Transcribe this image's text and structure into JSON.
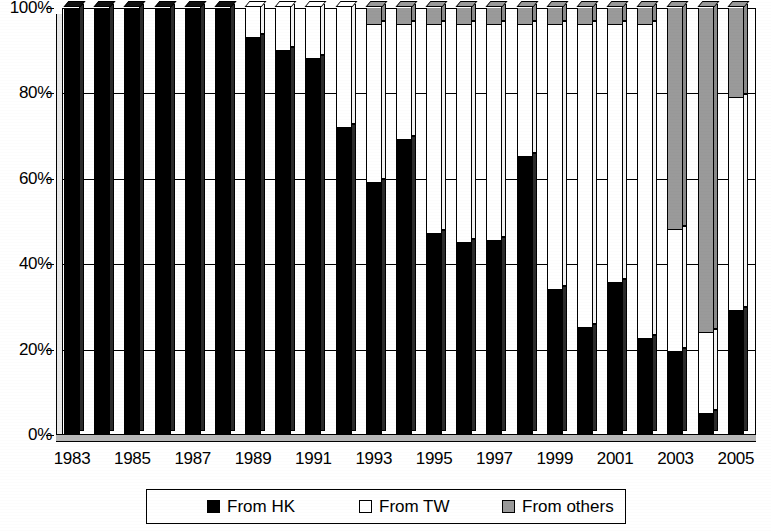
{
  "chart_data": {
    "type": "bar",
    "subtype": "stacked-percentage",
    "title": "",
    "subtitle": "",
    "xlabel": "",
    "ylabel": "",
    "ylim": [
      0,
      100
    ],
    "y_unit": "%",
    "grid": true,
    "legend_position": "bottom",
    "tick_label_interval": 2,
    "x": [
      "1983",
      "1984",
      "1985",
      "1986",
      "1987",
      "1988",
      "1989",
      "1990",
      "1991",
      "1992",
      "1993",
      "1994",
      "1995",
      "1996",
      "1997",
      "1998",
      "1999",
      "2000",
      "2001",
      "2002",
      "2003",
      "2004",
      "2005"
    ],
    "categories": [
      "1983",
      "1984",
      "1985",
      "1986",
      "1987",
      "1988",
      "1989",
      "1990",
      "1991",
      "1992",
      "1993",
      "1994",
      "1995",
      "1996",
      "1997",
      "1998",
      "1999",
      "2000",
      "2001",
      "2002",
      "2003",
      "2004",
      "2005"
    ],
    "y_ticks": [
      0,
      20,
      40,
      60,
      80,
      100
    ],
    "y_tick_labels": [
      "0%",
      "20%",
      "40%",
      "60%",
      "80%",
      "100%"
    ],
    "x_tick_labels": [
      "1983",
      "1985",
      "1987",
      "1989",
      "1991",
      "1993",
      "1995",
      "1997",
      "1999",
      "2001",
      "2003",
      "2005"
    ],
    "series": [
      {
        "name": "From HK",
        "color": "#000000",
        "values": [
          100,
          100,
          100,
          100,
          100,
          100,
          93,
          90,
          88,
          72,
          59,
          69,
          47,
          45,
          45.5,
          65,
          34,
          25,
          35.5,
          22.5,
          19.5,
          5,
          29
        ]
      },
      {
        "name": "From TW",
        "color": "#FFFFFF",
        "values": [
          0,
          0,
          0,
          0,
          0,
          0,
          7,
          10,
          12,
          28,
          37,
          27,
          49,
          51,
          50.5,
          31,
          62,
          71,
          60.5,
          73.5,
          28.5,
          19,
          50
        ]
      },
      {
        "name": "From others",
        "color": "#9A9A9A",
        "values": [
          0,
          0,
          0,
          0,
          0,
          0,
          0,
          0,
          0,
          0,
          4,
          4,
          4,
          4,
          4,
          4,
          4,
          4,
          4,
          4,
          52,
          76,
          21
        ]
      }
    ]
  },
  "legend": {
    "items": [
      {
        "label": "From HK",
        "swatch_class": "sw-hk"
      },
      {
        "label": "From TW",
        "swatch_class": "sw-tw"
      },
      {
        "label": "From others",
        "swatch_class": "sw-other"
      }
    ]
  }
}
